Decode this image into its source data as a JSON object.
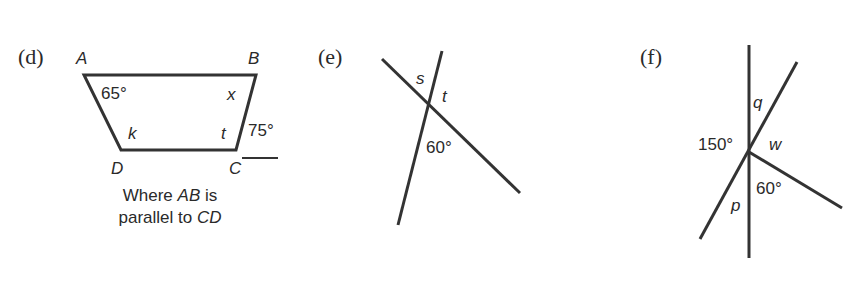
{
  "diagrams": {
    "d": {
      "part_label": "(d)",
      "vertices": {
        "A": "A",
        "B": "B",
        "C": "C",
        "D": "D"
      },
      "angles": {
        "A": "65°",
        "B": "x",
        "D": "k",
        "C": "t",
        "exterior_C": "75°"
      },
      "caption": {
        "line1_prefix": "Where ",
        "line1_italic": "AB",
        "line1_suffix": " is",
        "line2_prefix": "parallel to ",
        "line2_italic": "CD"
      }
    },
    "e": {
      "part_label": "(e)",
      "angles": {
        "s": "s",
        "t": "t",
        "given": "60°"
      }
    },
    "f": {
      "part_label": "(f)",
      "angles": {
        "q": "q",
        "w": "w",
        "p": "p",
        "left": "150°",
        "lower": "60°"
      }
    }
  },
  "colors": {
    "stroke": "#333333",
    "text": "#2a2a2a",
    "background": "#ffffff"
  }
}
